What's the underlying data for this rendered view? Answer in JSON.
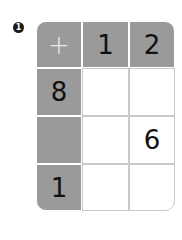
{
  "problem_number": "1",
  "operator": "+",
  "column_headers": [
    "1",
    "2"
  ],
  "row_headers": [
    "8",
    "",
    "1"
  ],
  "cells": [
    [
      "",
      ""
    ],
    [
      "",
      "6"
    ],
    [
      "",
      ""
    ]
  ]
}
